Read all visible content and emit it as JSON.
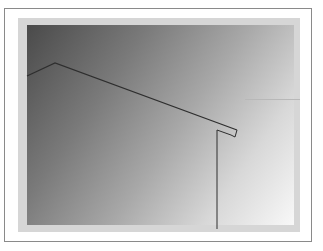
{
  "figure": {
    "type": "roof-eave line drawing on gradient panel",
    "colors": {
      "border": "#8a8a8a",
      "frame": "#d6d6d6",
      "gradient_dark": "#4a4a4a",
      "gradient_light": "#f8f8f8",
      "line": "#2e2e2e"
    },
    "roof_line": [
      [
        27,
        76
      ],
      [
        55,
        63
      ],
      [
        237,
        130
      ]
    ],
    "eave_tip": [
      [
        237,
        130
      ],
      [
        234,
        137
      ],
      [
        231,
        135
      ]
    ],
    "wall_line": [
      [
        217,
        130
      ],
      [
        232,
        134
      ],
      [
        217,
        130
      ],
      [
        217,
        228
      ]
    ]
  }
}
